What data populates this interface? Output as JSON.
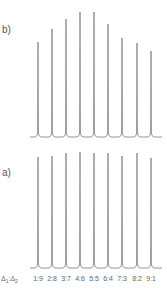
{
  "chart_data": [
    {
      "type": "line",
      "panel": "b)",
      "description": "Series of 9 sharp spectral peaks with varying intensity",
      "categories": [
        "1:9",
        "2:8",
        "3:7",
        "4:6",
        "5:5",
        "6:4",
        "7:3",
        "8:2",
        "9:1"
      ],
      "values": [
        0.76,
        0.86,
        0.94,
        1.0,
        1.0,
        0.9,
        0.79,
        0.75,
        0.69
      ],
      "x_px": [
        38,
        52,
        66,
        80,
        94,
        108,
        122,
        137,
        151
      ],
      "top_px": [
        42,
        29,
        19,
        12,
        12,
        24,
        38,
        43,
        51
      ],
      "baseline_px": 137,
      "xlabel": "",
      "ylabel": "",
      "grid": false
    },
    {
      "type": "line",
      "panel": "a)",
      "description": "Series of 9 sharp spectral peaks of nearly equal intensity",
      "categories": [
        "1:9",
        "2:8",
        "3:7",
        "4:6",
        "5:5",
        "6:4",
        "7:3",
        "8:2",
        "9:1"
      ],
      "values": [
        0.95,
        0.96,
        0.99,
        1.0,
        0.99,
        0.99,
        0.96,
        0.99,
        0.94
      ],
      "x_px": [
        38,
        52,
        66,
        80,
        94,
        108,
        122,
        137,
        151
      ],
      "top_px": [
        157,
        156,
        153,
        152,
        153,
        153,
        156,
        153,
        158
      ],
      "baseline_px": 268,
      "xlabel": "Δ1:Δ2",
      "ylabel": "",
      "grid": false
    }
  ],
  "labels": {
    "panel_b": "b)",
    "panel_a": "a)",
    "axis_prefix": "Δ",
    "axis_sub1": "1",
    "axis_sep": ":",
    "axis_sub2": "2",
    "ticks": [
      "1:9",
      "2:8",
      "3:7",
      "4:6",
      "5:5",
      "6:4",
      "7:3",
      "8:2",
      "9:1"
    ]
  },
  "colors": {
    "peak": "#8a8a8a",
    "text": "#555555"
  }
}
